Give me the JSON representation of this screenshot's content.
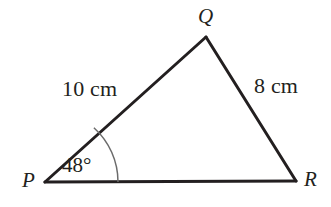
{
  "figure": {
    "type": "triangle-diagram",
    "background_color": "#ffffff",
    "stroke_color": "#231f20",
    "arc_color": "#5a5a5a",
    "vertices": {
      "p": {
        "label": "P",
        "x": 45,
        "y": 182
      },
      "q": {
        "label": "Q",
        "x": 206,
        "y": 37
      },
      "r": {
        "label": "R",
        "x": 296,
        "y": 181
      }
    },
    "sides": [
      {
        "name": "PQ",
        "label": "10 cm",
        "value": 10,
        "unit": "cm"
      },
      {
        "name": "QR",
        "label": "8 cm",
        "value": 8,
        "unit": "cm"
      },
      {
        "name": "PR",
        "label": "",
        "value": null,
        "unit": ""
      }
    ],
    "angles": [
      {
        "at": "P",
        "label": "48°",
        "value": 48,
        "unit": "degrees",
        "arc_radius": 73
      }
    ]
  }
}
